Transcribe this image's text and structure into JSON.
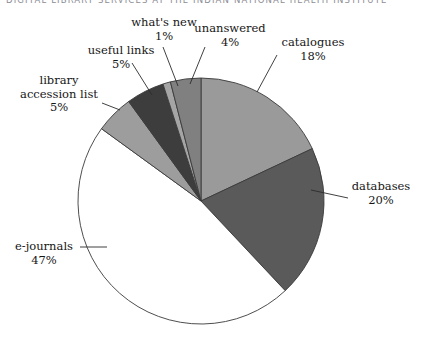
{
  "header": {
    "running_text": "DIGITAL LIBRARY SERVICES AT THE INDIAN NATIONAL HEALTH INSTITUTE"
  },
  "chart_data": {
    "type": "pie",
    "title": "",
    "xlabel": "",
    "ylabel": "",
    "legend_position": "none",
    "grid": false,
    "units": "percent",
    "total": 100,
    "categories": [
      "catalogues",
      "databases",
      "e-journals",
      "library accession list",
      "useful links",
      "what's new",
      "unanswered"
    ],
    "values": [
      18,
      20,
      47,
      5,
      5,
      1,
      4
    ],
    "slices": [
      {
        "label": "catalogues",
        "value": 18,
        "display": "18%",
        "color": "#9a9a9a"
      },
      {
        "label": "databases",
        "value": 20,
        "display": "20%",
        "color": "#5a5a5a"
      },
      {
        "label": "e-journals",
        "value": 47,
        "display": "47%",
        "color": "#ffffff"
      },
      {
        "label": "library accession list",
        "value": 5,
        "display": "5%",
        "color": "#9d9d9d"
      },
      {
        "label": "useful links",
        "value": 5,
        "display": "5%",
        "color": "#3d3d3d"
      },
      {
        "label": "what's new",
        "value": 1,
        "display": "1%",
        "color": "#a5a5a5"
      },
      {
        "label": "unanswered",
        "value": 4,
        "display": "4%",
        "color": "#808080"
      }
    ]
  },
  "labels": {
    "whats_new": {
      "name": "what's new",
      "pct": "1%"
    },
    "unanswered": {
      "name": "unanswered",
      "pct": "4%"
    },
    "catalogues": {
      "name": "catalogues",
      "pct": "18%"
    },
    "databases": {
      "name": "databases",
      "pct": "20%"
    },
    "useful_links": {
      "name": "useful links",
      "pct": "5%"
    },
    "accession_l1": {
      "name": "library",
      "l2": "accession list",
      "pct": "5%"
    },
    "ejournals": {
      "name": "e-journals",
      "pct": "47%"
    }
  },
  "colors": {
    "outline": "#3a3a3a",
    "leader": "#2b2b2b",
    "catalogues": "#9a9a9a",
    "databases": "#5a5a5a",
    "ejournals": "#ffffff",
    "accession": "#9d9d9d",
    "useful_links": "#3d3d3d",
    "whats_new": "#a5a5a5",
    "unanswered": "#808080"
  }
}
